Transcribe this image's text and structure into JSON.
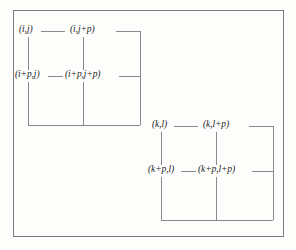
{
  "figure": {
    "background_color": "#fdfdfc",
    "border_color": "#7c7c7c",
    "line_color": "#8a8a8a",
    "text_color": "#1d1d1d"
  },
  "groups": [
    {
      "id": "group-1",
      "position": "top-left",
      "nodes": [
        {
          "id": "n00",
          "label": "(i,j)"
        },
        {
          "id": "n01",
          "label": "(i,j+p)"
        },
        {
          "id": "n10",
          "label": "(i+p,j)"
        },
        {
          "id": "n11",
          "label": "(i+p,j+p)"
        }
      ]
    },
    {
      "id": "group-2",
      "position": "bottom-right",
      "nodes": [
        {
          "id": "n00",
          "label": "(k,l)"
        },
        {
          "id": "n01",
          "label": "(k,l+p)"
        },
        {
          "id": "n10",
          "label": "(k+p,l)"
        },
        {
          "id": "n11",
          "label": "(k+p,l+p)"
        }
      ]
    }
  ]
}
